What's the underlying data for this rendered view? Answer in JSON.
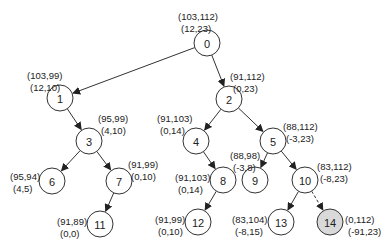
{
  "diagram": {
    "type": "tree",
    "nodes": [
      {
        "id": "0",
        "x": 207,
        "y": 43,
        "l1": "(103,112)",
        "l2": "(12,23)",
        "lx": 178,
        "ly": 12,
        "anchor": "start"
      },
      {
        "id": "1",
        "x": 60,
        "y": 98,
        "l1": "(103,99)",
        "l2": "(12,10)",
        "lx": 27,
        "ly": 71,
        "anchor": "start"
      },
      {
        "id": "2",
        "x": 229,
        "y": 99,
        "l1": "(91,112)",
        "l2": "(0,23)",
        "lx": 230,
        "ly": 72,
        "anchor": "start"
      },
      {
        "id": "3",
        "x": 89,
        "y": 141,
        "l1": "(95,99)",
        "l2": "(4,10)",
        "lx": 98,
        "ly": 114,
        "anchor": "start"
      },
      {
        "id": "4",
        "x": 196,
        "y": 141,
        "l1": "(91,103)",
        "l2": "(0,14)",
        "lx": 157,
        "ly": 114,
        "anchor": "start"
      },
      {
        "id": "5",
        "x": 273,
        "y": 141,
        "l1": "(88,112)",
        "l2": "(-3,23)",
        "lx": 283,
        "ly": 122,
        "anchor": "start"
      },
      {
        "id": "6",
        "x": 52,
        "y": 181,
        "l1": "(95,94)",
        "l2": "(4,5)",
        "lx": 10,
        "ly": 172,
        "anchor": "start"
      },
      {
        "id": "7",
        "x": 119,
        "y": 181,
        "l1": "(91,99)",
        "l2": "(0,10)",
        "lx": 128,
        "ly": 160,
        "anchor": "start"
      },
      {
        "id": "8",
        "x": 223,
        "y": 180,
        "l1": "(91,103)",
        "l2": "(0,14)",
        "lx": 175,
        "ly": 173,
        "anchor": "start"
      },
      {
        "id": "9",
        "x": 255,
        "y": 180,
        "l1": "(88,98)",
        "l2": "(-3,8)",
        "lx": 230,
        "ly": 151,
        "anchor": "start"
      },
      {
        "id": "10",
        "x": 305,
        "y": 180,
        "l1": "(83,112)",
        "l2": "(-8,23)",
        "lx": 317,
        "ly": 162,
        "anchor": "start"
      },
      {
        "id": "11",
        "x": 100,
        "y": 224,
        "l1": "(91,89)",
        "l2": "(0,0)",
        "lx": 57,
        "ly": 217,
        "anchor": "start"
      },
      {
        "id": "12",
        "x": 198,
        "y": 222,
        "l1": "(91,99)",
        "l2": "(0,10)",
        "lx": 155,
        "ly": 215,
        "anchor": "start"
      },
      {
        "id": "13",
        "x": 281,
        "y": 222,
        "l1": "(83,104)",
        "l2": "(-8,15)",
        "lx": 232,
        "ly": 215,
        "anchor": "start"
      },
      {
        "id": "14",
        "x": 330,
        "y": 222,
        "l1": "(0,112)",
        "l2": "(-91,23)",
        "lx": 345,
        "ly": 215,
        "anchor": "start",
        "highlight": true
      }
    ],
    "edges": [
      {
        "from": "0",
        "to": "1"
      },
      {
        "from": "0",
        "to": "2"
      },
      {
        "from": "1",
        "to": "3"
      },
      {
        "from": "2",
        "to": "4"
      },
      {
        "from": "2",
        "to": "5"
      },
      {
        "from": "3",
        "to": "6"
      },
      {
        "from": "3",
        "to": "7"
      },
      {
        "from": "4",
        "to": "8"
      },
      {
        "from": "5",
        "to": "9"
      },
      {
        "from": "5",
        "to": "10"
      },
      {
        "from": "7",
        "to": "11"
      },
      {
        "from": "8",
        "to": "12"
      },
      {
        "from": "10",
        "to": "13"
      },
      {
        "from": "10",
        "to": "14",
        "dashed": true
      }
    ],
    "node_radius": 13,
    "colors": {
      "stroke": "#333333",
      "highlight_fill": "#d9d9d9",
      "fill": "#ffffff"
    }
  }
}
